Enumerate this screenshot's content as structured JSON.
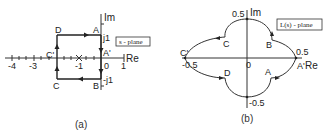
{
  "panel_a": {
    "plane_label": "s - plane",
    "axis_re": "Re",
    "axis_im": "Im",
    "ticks_re": [
      "-4",
      "-3",
      "-1",
      "0",
      "1"
    ],
    "ticks_im": [
      "j1",
      "-j1"
    ],
    "points": [
      "A",
      "A'",
      "B",
      "C",
      "C'",
      "D"
    ],
    "pole_marker": "x",
    "caption": "(a)"
  },
  "panel_b": {
    "plane_label": "L(s) - plane",
    "axis_re": "Re",
    "axis_im": "Im",
    "ticks_re": [
      "-0.5",
      "0",
      "0.5"
    ],
    "ticks_im": [
      "0.5",
      "-0.5"
    ],
    "points": [
      "A",
      "A'",
      "B",
      "C",
      "C'",
      "D"
    ],
    "caption": "(b)"
  },
  "colors": {
    "line": "#222222",
    "background": "#ffffff"
  }
}
